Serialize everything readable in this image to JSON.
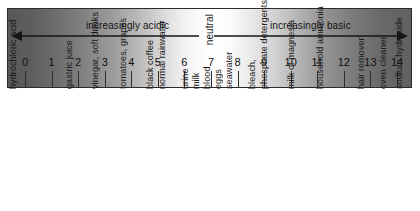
{
  "figure": {
    "bands": {
      "acidic_label": "increasingly acidic",
      "neutral_label": "neutral",
      "basic_label": "increasingly basic"
    },
    "colors": {
      "acidic_end": "#585858",
      "neutral_mid": "#ffffff",
      "basic_end": "#606060",
      "ink": "#151515",
      "border": "#2b2b2b"
    }
  },
  "chart_data": {
    "type": "bar",
    "xlabel": "pH",
    "ylabel": "",
    "xlim": [
      0,
      14
    ],
    "grid": false,
    "legend": "none",
    "categories": [
      "0",
      "1",
      "2",
      "3",
      "4",
      "5",
      "6",
      "7",
      "8",
      "9",
      "10",
      "11",
      "12",
      "13",
      "14"
    ],
    "values": [
      0,
      1,
      2,
      3,
      4,
      5,
      6,
      7,
      8,
      9,
      10,
      11,
      12,
      13,
      14
    ],
    "tick_labels": [
      "0",
      "1",
      "2",
      "3",
      "4",
      "5",
      "6",
      "7",
      "8",
      "9",
      "10",
      "11",
      "12",
      "13",
      "14"
    ],
    "regions": [
      {
        "name": "increasingly acidic",
        "from": 0,
        "to": 7
      },
      {
        "name": "neutral",
        "from": 7,
        "to": 7
      },
      {
        "name": "increasingly basic",
        "from": 7,
        "to": 14
      }
    ],
    "annotations": [
      {
        "label": "hydrochloric acid",
        "ph": 0.0,
        "x": 18
      },
      {
        "label": "gastric juice",
        "ph": 2.0,
        "x": 74
      },
      {
        "label": "vinegar, soft drinks",
        "ph": 3.0,
        "x": 100
      },
      {
        "label": "tomatoes, grapes",
        "ph": 4.0,
        "x": 128
      },
      {
        "label": "black coffee",
        "ph": 5.0,
        "x": 155
      },
      {
        "label": "normal rainwater",
        "ph": 5.4,
        "x": 167
      },
      {
        "label": "urine",
        "ph": 6.2,
        "x": 190
      },
      {
        "label": "milk",
        "ph": 6.6,
        "x": 201
      },
      {
        "label": "blood",
        "ph": 7.4,
        "x": 212
      },
      {
        "label": "eggs",
        "ph": 7.8,
        "x": 223
      },
      {
        "label": "seawater",
        "ph": 8.2,
        "x": 234
      },
      {
        "label": "bleach,",
        "ph": 9.0,
        "x": 257
      },
      {
        "label": "phosphate detergents",
        "ph": 9.3,
        "x": 269
      },
      {
        "label": "milk of magnesia",
        "ph": 10.0,
        "x": 296
      },
      {
        "label": "household ammonia",
        "ph": 11.0,
        "x": 325
      },
      {
        "label": "hair remover",
        "ph": 12.5,
        "x": 366
      },
      {
        "label": "oven cleaner",
        "ph": 13.3,
        "x": 388
      },
      {
        "label": "sodium hydroxide",
        "ph": 14.0,
        "x": 404
      }
    ]
  }
}
